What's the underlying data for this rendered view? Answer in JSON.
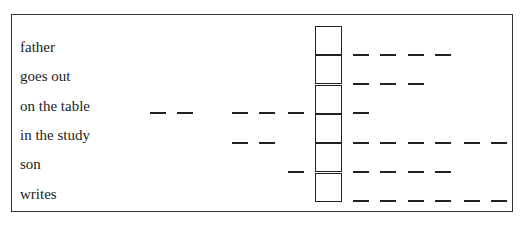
{
  "diagram": {
    "labels": [
      "father",
      "goes out",
      "on the table",
      "in the study",
      "son",
      "writes"
    ],
    "cells": 6,
    "left_dashes": [
      [],
      [],
      [
        150,
        177,
        232,
        259,
        288
      ],
      [
        232,
        259
      ],
      [
        288
      ],
      []
    ],
    "right_dashes": [
      [
        353,
        380,
        408,
        435
      ],
      [
        353,
        380,
        408
      ],
      [
        353
      ],
      [
        353,
        380,
        408,
        435,
        464,
        491
      ],
      [
        353,
        380,
        408,
        435
      ],
      [
        353,
        380,
        408,
        435,
        464,
        491
      ]
    ],
    "dash_rows_y": [
      54,
      83,
      112,
      142,
      171,
      200
    ]
  }
}
